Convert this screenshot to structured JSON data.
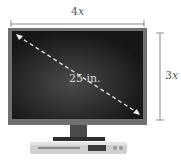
{
  "diagram": {
    "width_label": {
      "coef": "4",
      "var": "x"
    },
    "height_label": {
      "coef": "3",
      "var": "x"
    },
    "diagonal_label": "25 in.",
    "colors": {
      "dimension_line": "#888888",
      "bezel": "#6e6e6e",
      "screen": "#1e1e1e",
      "diagonal": "#e8e8e8",
      "stand": "#3a3a3a",
      "player": "#cfcfcf"
    }
  }
}
